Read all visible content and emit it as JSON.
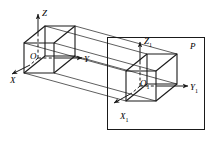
{
  "figure": {
    "kind": "engineering-projection-diagram",
    "stroke_color": "#1a1a1a",
    "background_color": "#ffffff"
  },
  "labels": {
    "origin_o": "O",
    "axis_z": "Z",
    "axis_y": "Y",
    "axis_x": "X",
    "origin_o1_main": "O",
    "origin_o1_sub": "1",
    "axis_z1_main": "Z",
    "axis_z1_sub": "1",
    "axis_y1_main": "Y",
    "axis_y1_sub": "1",
    "axis_x1_main": "X",
    "axis_x1_sub": "1",
    "plane_p": "P"
  },
  "geometry": {
    "plane": {
      "x": 107,
      "y": 37,
      "width": 98,
      "height": 93
    },
    "source_cube": {
      "front_face": [
        [
          24,
          43
        ],
        [
          54,
          43
        ],
        [
          54,
          73
        ],
        [
          24,
          73
        ]
      ],
      "depth_offset": [
        21,
        -17
      ]
    },
    "target_cube": {
      "front_face": [
        [
          126,
          71
        ],
        [
          156,
          71
        ],
        [
          156,
          101
        ],
        [
          126,
          101
        ]
      ],
      "depth_offset": [
        21,
        -17
      ]
    },
    "axes_o": {
      "z_tip": [
        38,
        12
      ],
      "y_tip": [
        88,
        58
      ],
      "x_tip": [
        10,
        76
      ]
    },
    "axes_o1": {
      "z_tip": [
        140,
        40
      ],
      "y_tip": [
        192,
        86
      ],
      "x_tip": [
        112,
        104
      ]
    },
    "projection_ray_count": 6
  }
}
